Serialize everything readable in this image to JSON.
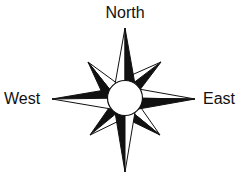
{
  "compass": {
    "labels": {
      "north": "North",
      "west": "West",
      "east": "East"
    },
    "colors": {
      "ink": "#111111",
      "paper": "#ffffff"
    }
  }
}
